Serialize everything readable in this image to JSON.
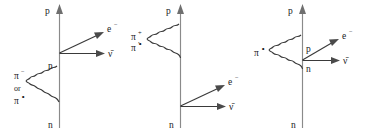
{
  "figure": {
    "background_color": "#ffffff",
    "line_color": "#3a3a3a",
    "axis_color": "#8a8a8a",
    "text_color": "#1a1a1a"
  },
  "diagrams": [
    {
      "id": "diagram-1",
      "labels": {
        "top_nucleon": "p",
        "upper_inner_nucleon": "n",
        "bottom_nucleon": "n",
        "lepton": "e",
        "lepton_sup": "−",
        "antineutrino": "ν̄",
        "pion_first": "π",
        "pion_first_sup": "−",
        "pion_conjunction": "or",
        "pion_second": "π",
        "pion_second_sup": "∘"
      }
    },
    {
      "id": "diagram-2",
      "labels": {
        "top_nucleon": "p",
        "bottom_nucleon": "n",
        "lepton": "e",
        "lepton_sup": "−",
        "antineutrino": "ν̄",
        "pion_first": "π",
        "pion_first_sup": "+",
        "pion_separator": ",",
        "pion_second": "π",
        "pion_second_sup": "∘"
      }
    },
    {
      "id": "diagram-3",
      "labels": {
        "top_nucleon": "p",
        "bottom_nucleon": "n",
        "vertex_upper": "p",
        "vertex_lower": "n",
        "lepton": "e",
        "lepton_sup": "−",
        "antineutrino": "ν̄",
        "pion": "π",
        "pion_sup": "∘"
      }
    }
  ]
}
